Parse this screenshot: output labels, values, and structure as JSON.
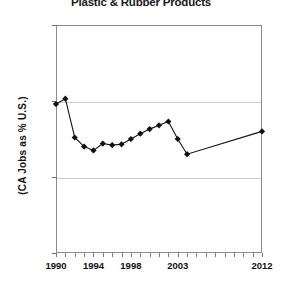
{
  "chart_data": {
    "type": "line",
    "title": "Plastic & Rubber Products",
    "xlabel": "",
    "ylabel": "(CA Jobs as % U.S.)",
    "ylim": [
      6,
      9
    ],
    "xlim": [
      1990,
      2012
    ],
    "grid": true,
    "legend": "none",
    "y_tick_labels": [
      "9%",
      "8%",
      "7%",
      "6%"
    ],
    "y_tick_values": [
      9,
      8,
      7,
      6
    ],
    "x_tick_labels": [
      "1990",
      "1994",
      "1998",
      "2003",
      "2012"
    ],
    "x_tick_values": [
      1990,
      1994,
      1998,
      2003,
      2012
    ],
    "x_minor_ticks": [
      1990,
      1991,
      1992,
      1993,
      1994,
      1995,
      1996,
      1997,
      1998,
      1999,
      2000,
      2001,
      2002,
      2003,
      2004,
      2005,
      2006,
      2007,
      2008,
      2009,
      2010,
      2011,
      2012
    ],
    "marker": "diamond",
    "series": [
      {
        "name": "CA Jobs as % U.S. — Plastic & Rubber Products",
        "x": [
          1990,
          1991,
          1992,
          1993,
          1994,
          1995,
          1996,
          1997,
          1998,
          1999,
          2000,
          2001,
          2002,
          2003,
          2004,
          2012
        ],
        "values": [
          7.96,
          8.03,
          7.52,
          7.4,
          7.35,
          7.44,
          7.42,
          7.43,
          7.5,
          7.57,
          7.63,
          7.68,
          7.73,
          7.5,
          7.3,
          7.6
        ]
      }
    ]
  }
}
